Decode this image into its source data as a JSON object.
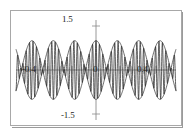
{
  "figure": {
    "background_color": "#ffffff",
    "frame_color": "#a8a8a8",
    "curve_color": "#2b2b2b",
    "axis_color": "#8c8c8c"
  },
  "labels": {
    "y_max": "1.5",
    "y_min": "-1.5",
    "x_min": "-0.4",
    "x_zero": "0",
    "x_max": "0.4"
  },
  "chart_data": {
    "type": "line",
    "title": "",
    "subtitle": "",
    "xlabel": "",
    "ylabel": "",
    "xlim": [
      -0.5,
      0.5
    ],
    "ylim": [
      -1.5,
      1.5
    ],
    "grid": false,
    "legend": "none",
    "x_ticks": [
      -0.4,
      0,
      0.4
    ],
    "x_tick_labels": [
      "-0.4",
      "0",
      "0.4"
    ],
    "y_ticks": [
      -1.5,
      1.5
    ],
    "y_tick_labels": [
      "-1.5",
      "1.5"
    ],
    "series": [
      {
        "name": "signal",
        "kind": "oscillation",
        "formula": "y = cos(2*pi*3.75*x) * cos(2*pi*47*x)",
        "envelope_amplitude": 1.0,
        "envelope_frequency_hz": 3.75,
        "carrier_frequency_hz": 47,
        "lobe_count": 3,
        "node_x": [
          -0.1333,
          0.1333
        ]
      },
      {
        "name": "upper-envelope",
        "kind": "envelope",
        "formula": "y = cos(2*pi*3.75*x)",
        "amplitude": 1.0
      },
      {
        "name": "lower-envelope",
        "kind": "envelope",
        "formula": "y = -cos(2*pi*3.75*x)",
        "amplitude": 1.0
      }
    ]
  }
}
